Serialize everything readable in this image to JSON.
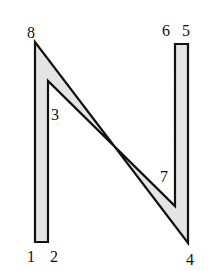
{
  "diagram": {
    "shape": "letter-N polygon",
    "fill_color": "#e4e4e4",
    "stroke_color": "#111111",
    "vertices": [
      {
        "id": "1",
        "x": 35,
        "y": 242
      },
      {
        "id": "2",
        "x": 48,
        "y": 242
      },
      {
        "id": "3",
        "x": 48,
        "y": 81
      },
      {
        "id": "7",
        "x": 175,
        "y": 206
      },
      {
        "id": "6",
        "x": 175,
        "y": 44
      },
      {
        "id": "5",
        "x": 188,
        "y": 44
      },
      {
        "id": "4",
        "x": 188,
        "y": 243
      },
      {
        "id": "8",
        "x": 35,
        "y": 42
      }
    ],
    "labels": {
      "v1": "1",
      "v2": "2",
      "v3": "3",
      "v4": "4",
      "v5": "5",
      "v6": "6",
      "v7": "7",
      "v8": "8"
    }
  }
}
